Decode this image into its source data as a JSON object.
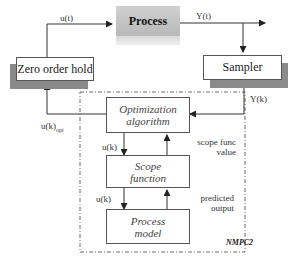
{
  "diagram": {
    "blocks": {
      "process": "Process",
      "zero_order_hold": "Zero order hold",
      "sampler": "Sampler",
      "optimization_line1": "Optimization",
      "optimization_line2": "algorithm",
      "scope_line1": "Scope",
      "scope_line2": "function",
      "process_model_line1": "Process",
      "process_model_line2": "model"
    },
    "signals": {
      "u_t": "u(t)",
      "y_t": "Y(t)",
      "y_k": "Y(k)",
      "u_k_opt_main": "u(k)",
      "u_k_opt_sub": "opt",
      "u_k_1": "u(k)",
      "u_k_2": "u(k)",
      "scope_func_value_line1": "scope func",
      "scope_func_value_line2": "value",
      "predicted_output_line1": "predicted",
      "predicted_output_line2": "output"
    },
    "group_label": "NMPC2",
    "colors": {
      "line": "#333333",
      "shadow": "#8a8a8a",
      "process_fill": "#c4c4c4"
    }
  }
}
